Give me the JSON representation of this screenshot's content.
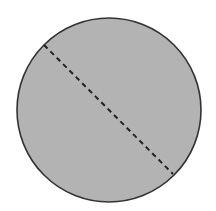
{
  "diagram": {
    "type": "geometry",
    "circle": {
      "cx": 109,
      "cy": 110,
      "r": 92,
      "fill": "#b3b3b3",
      "stroke": "#333333",
      "stroke_width": 1.6
    },
    "dashed_line": {
      "x1": 44,
      "y1": 45,
      "x2": 173,
      "y2": 174,
      "stroke": "#222222",
      "stroke_width": 2,
      "dasharray": "5,4"
    },
    "background": "#ffffff"
  }
}
